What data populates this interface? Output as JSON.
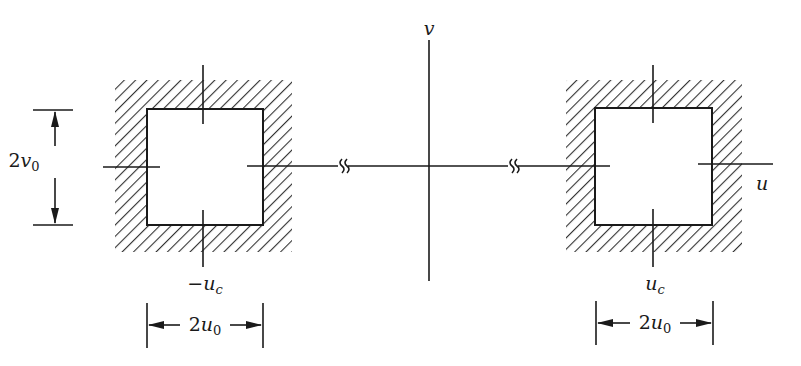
{
  "figure": {
    "axes": {
      "horizontal_label": "u",
      "vertical_label": "v"
    },
    "left_region": {
      "center_label_sign": "−",
      "center_label_var": "u",
      "center_label_sub": "c",
      "width_dim_num": "2",
      "width_dim_var": "u",
      "width_dim_sub": "0",
      "height_dim_num": "2",
      "height_dim_var": "v",
      "height_dim_sub": "0"
    },
    "right_region": {
      "center_label_var": "u",
      "center_label_sub": "c",
      "width_dim_num": "2",
      "width_dim_var": "u",
      "width_dim_sub": "0"
    },
    "axis_break_symbol": "≈",
    "colors": {
      "ink": "#1a1a1a",
      "background": "#ffffff"
    }
  }
}
